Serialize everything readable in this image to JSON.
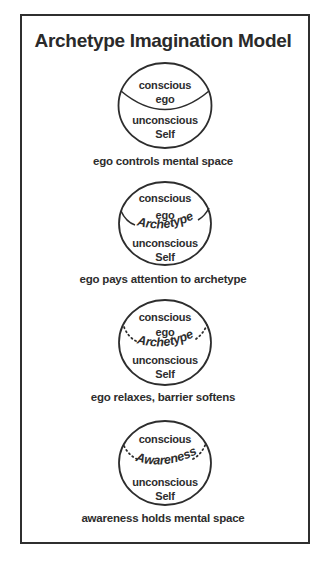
{
  "title": "Archetype Imagination Model",
  "stages": [
    {
      "top_labels": [
        "conscious",
        "ego"
      ],
      "arc_label": "",
      "bottom_labels": [
        "unconscious",
        "Self"
      ],
      "barrier": "solid-full",
      "caption": "ego controls mental space"
    },
    {
      "top_labels": [
        "conscious",
        "ego"
      ],
      "arc_label": "Archetype",
      "bottom_labels": [
        "unconscious",
        "Self"
      ],
      "barrier": "solid-broken",
      "caption": "ego pays attention to archetype"
    },
    {
      "top_labels": [
        "conscious",
        "ego"
      ],
      "arc_label": "Archetype",
      "bottom_labels": [
        "unconscious",
        "Self"
      ],
      "barrier": "dotted",
      "caption": "ego relaxes, barrier softens"
    },
    {
      "top_labels": [
        "conscious"
      ],
      "arc_label": "Awareness",
      "bottom_labels": [
        "unconscious",
        "Self"
      ],
      "barrier": "dotted",
      "caption": "awareness holds mental space"
    }
  ],
  "colors": {
    "ink": "#2d2d2d",
    "frame": "#2f2f2f",
    "background": "#ffffff"
  }
}
